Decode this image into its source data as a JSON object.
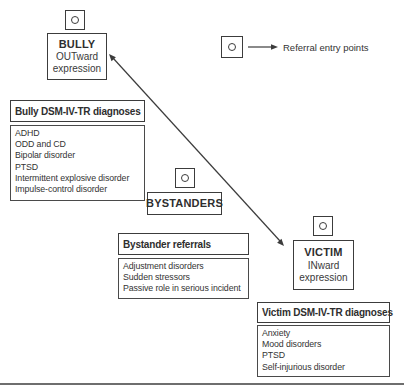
{
  "figure": {
    "legend_label": "Referral entry points"
  },
  "nodes": {
    "bully": {
      "title": "BULLY",
      "subtitle1": "OUTward",
      "subtitle2": "expression"
    },
    "bystanders": {
      "title": "BYSTANDERS"
    },
    "victim": {
      "title": "VICTIM",
      "subtitle1": "INward",
      "subtitle2": "expression"
    }
  },
  "panels": {
    "bully_diagnoses": {
      "header": "Bully DSM-IV-TR diagnoses",
      "items": [
        "ADHD",
        "ODD and CD",
        "Bipolar disorder",
        "PTSD",
        "Intermittent explosive disorder",
        "Impulse-control disorder"
      ]
    },
    "bystander_referrals": {
      "header": "Bystander referrals",
      "items": [
        "Adjustment disorders",
        "Sudden stressors",
        "Passive role in serious incident"
      ]
    },
    "victim_diagnoses": {
      "header": "Victim DSM-IV-TR diagnoses",
      "items": [
        "Anxiety",
        "Mood disorders",
        "PTSD",
        "Self-injurious disorder"
      ]
    }
  },
  "colors": {
    "ink": "#2e2e2e",
    "border": "#3c3c3c",
    "bottom_rule": "#6e6e6e",
    "background": "#ffffff"
  }
}
